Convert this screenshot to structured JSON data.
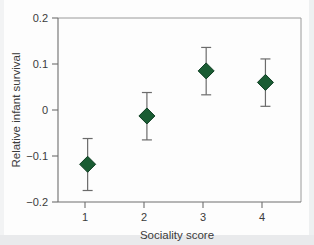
{
  "chart_data": {
    "type": "scatter",
    "title": "",
    "xlabel": "Sociality score",
    "ylabel": "Relative infant survival",
    "x": [
      1,
      2,
      3,
      4
    ],
    "categories": [
      "1",
      "2",
      "3",
      "4"
    ],
    "values": [
      -0.118,
      -0.013,
      0.085,
      0.06
    ],
    "error_low": [
      -0.175,
      -0.065,
      0.033,
      0.008
    ],
    "error_high": [
      -0.062,
      0.038,
      0.136,
      0.111
    ],
    "series": [
      {
        "name": "Relative infant survival",
        "values": [
          -0.118,
          -0.013,
          0.085,
          0.06
        ],
        "error_low": [
          -0.175,
          -0.065,
          0.033,
          0.008
        ],
        "error_high": [
          -0.062,
          0.038,
          0.136,
          0.111
        ],
        "marker": "diamond",
        "color": "#1a5c33"
      }
    ],
    "xlim": [
      0.5,
      4.6
    ],
    "ylim": [
      -0.2,
      0.2
    ],
    "xticks": [
      1,
      2,
      3,
      4
    ],
    "yticks": [
      -0.2,
      -0.1,
      0,
      0.1,
      0.2
    ],
    "xticklabels": [
      "1",
      "2",
      "3",
      "4"
    ],
    "yticklabels": [
      "−0.2",
      "−0.1",
      "0",
      "0.1",
      "0.2"
    ],
    "grid": false,
    "legend": false,
    "legend_position": "none",
    "marker_color": "#1a5c33",
    "error_bar_color": "#6b6b6b",
    "axis_color": "#6e6e6e"
  },
  "axes": {
    "y_tick_labels": [
      "0.2",
      "0.1",
      "0",
      "−0.1",
      "−0.2"
    ],
    "y_tick_values": [
      0.2,
      0.1,
      0,
      -0.1,
      -0.2
    ],
    "x_tick_labels": [
      "1",
      "2",
      "3",
      "4"
    ],
    "x_tick_values": [
      1,
      2,
      3,
      4
    ],
    "x_title": "Sociality score",
    "y_title": "Relative infant survival"
  }
}
